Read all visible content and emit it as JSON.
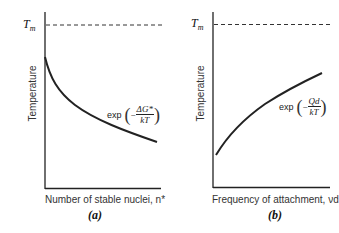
{
  "panels": [
    {
      "id": "a",
      "caption": "(a)",
      "ylabel": "Temperature",
      "xlabel": "Number of stable nuclei, n*",
      "reference_line": "Tm",
      "reference_sub": "m",
      "reference_main": "T",
      "expression_prefix": "exp",
      "expression_sign": "−",
      "expression_numerator": "ΔG*",
      "expression_denominator": "kT",
      "curve_trend": "decreasing"
    },
    {
      "id": "b",
      "caption": "(b)",
      "ylabel": "Temperature",
      "xlabel": "Frequency of attachment, νd",
      "reference_line": "Tm",
      "reference_sub": "m",
      "reference_main": "T",
      "expression_prefix": "exp",
      "expression_sign": "−",
      "expression_numerator": "Qd",
      "expression_denominator": "kT",
      "curve_trend": "increasing"
    }
  ],
  "colors": {
    "axis": "#222222",
    "curve": "#222222",
    "dashed": "#333333",
    "background": "#ffffff"
  }
}
